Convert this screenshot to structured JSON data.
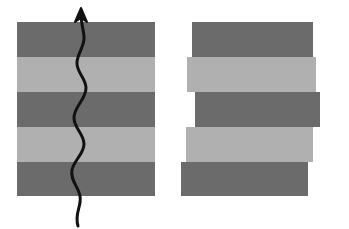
{
  "figure": {
    "name": "layered-strata-comparison",
    "background_color": "#ffffff",
    "canvas": {
      "width": 349,
      "height": 229
    }
  },
  "colors": {
    "dark_layer": "#6b6b6b",
    "light_layer": "#b0b0b0",
    "outline": "#555555",
    "arrow": "#111111",
    "background": "#ffffff"
  },
  "left_panel": {
    "label": "undeformed-layered-block",
    "block": {
      "x": 17,
      "y": 22,
      "width": 138,
      "height": 174
    },
    "layer_count": 5,
    "layers": [
      {
        "index": 1,
        "tone": "dark",
        "color": "#6b6b6b",
        "y": 0,
        "height": 35
      },
      {
        "index": 2,
        "tone": "light",
        "color": "#b0b0b0",
        "y": 35,
        "height": 35
      },
      {
        "index": 3,
        "tone": "dark",
        "color": "#6b6b6b",
        "y": 70,
        "height": 35
      },
      {
        "index": 4,
        "tone": "light",
        "color": "#b0b0b0",
        "y": 105,
        "height": 35
      },
      {
        "index": 5,
        "tone": "dark",
        "color": "#6b6b6b",
        "y": 140,
        "height": 34
      }
    ],
    "arrow": {
      "label": "upward-wavy-arrow",
      "direction": "up",
      "stroke_width": 3,
      "path": "M 78 226 C 74 214, 82 206, 80 196 C 78 186, 70 180, 72 170 C 74 160, 84 154, 84 144 C 84 134, 74 128, 74 118 C 74 106, 86 100, 86 88 C 86 78, 76 72, 77 62 C 78 52, 85 46, 84 36 C 83 28, 81 22, 81 14",
      "head": "M 81 8 L 75 22 L 81 18 L 87 22 Z"
    }
  },
  "right_panel": {
    "label": "faulted-offset-layered-block",
    "layer_count": 5,
    "layers": [
      {
        "index": 1,
        "tone": "dark",
        "color": "#6b6b6b",
        "x": 192,
        "y": 22,
        "width": 121,
        "height": 35,
        "offset": 0
      },
      {
        "index": 2,
        "tone": "light",
        "color": "#b0b0b0",
        "x": 187,
        "y": 57,
        "width": 129,
        "height": 35,
        "offset": -5
      },
      {
        "index": 3,
        "tone": "dark",
        "color": "#6b6b6b",
        "x": 195,
        "y": 92,
        "width": 125,
        "height": 35,
        "offset": 3
      },
      {
        "index": 4,
        "tone": "light",
        "color": "#b0b0b0",
        "x": 186,
        "y": 127,
        "width": 127,
        "height": 35,
        "offset": -6
      },
      {
        "index": 5,
        "tone": "dark",
        "color": "#6b6b6b",
        "x": 181,
        "y": 162,
        "width": 127,
        "height": 34,
        "offset": -11
      }
    ]
  }
}
